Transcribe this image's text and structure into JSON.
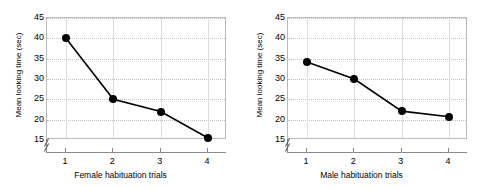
{
  "figure": {
    "background": "#ffffff",
    "marker_color": "#000000",
    "line_color": "#000000",
    "frame_color": "#b9b9b9",
    "grid_color": "#c4c4c4"
  },
  "chart_data": [
    {
      "type": "line",
      "title": "",
      "xlabel": "Female habituation trials",
      "ylabel": "Mean looking time (sec)",
      "x": [
        1,
        2,
        3,
        4
      ],
      "categories": [
        "1",
        "2",
        "3",
        "4"
      ],
      "values": [
        40,
        25,
        22,
        15.5
      ],
      "yticks": [
        15,
        20,
        25,
        30,
        35,
        40,
        45
      ],
      "ytick_labels": [
        "15",
        "20",
        "25",
        "30",
        "35",
        "40",
        "45"
      ],
      "xtick_labels": [
        "1",
        "2",
        "3",
        "4"
      ],
      "ylim": [
        15,
        45
      ],
      "xlim": [
        0.6,
        4.4
      ],
      "axis_break": true,
      "grid": true,
      "legend": false,
      "marker": "filled-circle"
    },
    {
      "type": "line",
      "title": "",
      "xlabel": "Male habituation trials",
      "ylabel": "Mean looking time (sec)",
      "x": [
        1,
        2,
        3,
        4
      ],
      "categories": [
        "1",
        "2",
        "3",
        "4"
      ],
      "values": [
        34.2,
        30,
        22.1,
        20.7
      ],
      "yticks": [
        15,
        20,
        25,
        30,
        35,
        40,
        45
      ],
      "ytick_labels": [
        "15",
        "20",
        "25",
        "30",
        "35",
        "40",
        "45"
      ],
      "xtick_labels": [
        "1",
        "2",
        "3",
        "4"
      ],
      "ylim": [
        15,
        45
      ],
      "xlim": [
        0.6,
        4.4
      ],
      "axis_break": true,
      "grid": true,
      "legend": false,
      "marker": "filled-circle"
    }
  ]
}
